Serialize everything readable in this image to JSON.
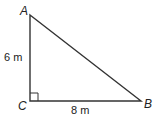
{
  "diagram": {
    "type": "right-triangle",
    "vertices": {
      "A": {
        "label": "A",
        "x": 30,
        "y": 15
      },
      "B": {
        "label": "B",
        "x": 141,
        "y": 101
      },
      "C": {
        "label": "C",
        "x": 30,
        "y": 101
      }
    },
    "sides": {
      "AC": {
        "label": "6 m"
      },
      "CB": {
        "label": "8 m"
      }
    },
    "right_angle_at": "C",
    "colors": {
      "stroke": "#333333",
      "text": "#222222",
      "background": "#ffffff"
    }
  }
}
